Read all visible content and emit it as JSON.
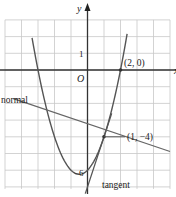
{
  "chart_data": {
    "type": "line",
    "title": "",
    "xlabel": "x",
    "ylabel": "y",
    "xlim": [
      -5,
      5
    ],
    "ylim": [
      -7,
      3
    ],
    "grid": true,
    "origin_label": "O",
    "y_tick_labels": [
      {
        "value": 1,
        "label": "1"
      },
      {
        "value": -6,
        "label": "-6"
      }
    ],
    "series": [
      {
        "name": "curve",
        "equation": "y = x^2 + x - 6",
        "x_range": [
          -3.36,
          2.4
        ]
      },
      {
        "name": "tangent",
        "equation": "y = 3x - 7",
        "label": "tangent"
      },
      {
        "name": "normal",
        "equation": "y = -x/3 - 11/3",
        "label": "normal"
      }
    ],
    "points": [
      {
        "x": 2,
        "y": 0,
        "label": "(2, 0)"
      },
      {
        "x": 1,
        "y": -4,
        "label": "(1, −4)"
      }
    ],
    "colors": {
      "grid": "#c8c8c8",
      "axis": "#333333",
      "curve": "#555555",
      "lines": "#5a5a5a"
    }
  },
  "labels": {
    "x_axis": "x",
    "y_axis": "y",
    "origin": "O",
    "tick_1": "1",
    "tick_neg6": "−6",
    "point_a": "(2, 0)",
    "point_b": "(1, −4)",
    "normal": "normal",
    "tangent": "tangent"
  }
}
